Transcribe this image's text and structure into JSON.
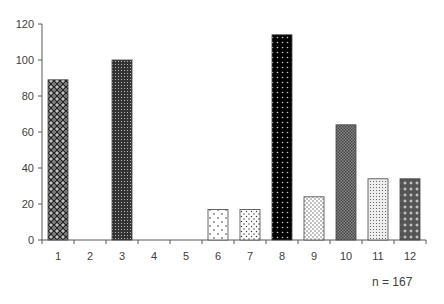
{
  "chart_data": {
    "type": "bar",
    "title": "",
    "xlabel": "",
    "ylabel": "",
    "categories": [
      "1",
      "2",
      "3",
      "4",
      "5",
      "6",
      "7",
      "8",
      "9",
      "10",
      "11",
      "12"
    ],
    "values": [
      89,
      0,
      100,
      0,
      0,
      17,
      17,
      114,
      24,
      64,
      34,
      34
    ],
    "ylim": [
      0,
      120
    ],
    "yticks": [
      0,
      20,
      40,
      60,
      80,
      100,
      120
    ],
    "grid": false,
    "legend": null,
    "annotation": "n = 167",
    "patterns": [
      "diamond-cross-gray",
      "none",
      "dense-dots-dark",
      "none",
      "none",
      "sparse-dots",
      "small-dots",
      "dots-on-black",
      "dots-light",
      "dense-checker-gray",
      "fine-dots-light",
      "plus-on-gray"
    ]
  },
  "annotation": {
    "n_label": "n = 167"
  }
}
